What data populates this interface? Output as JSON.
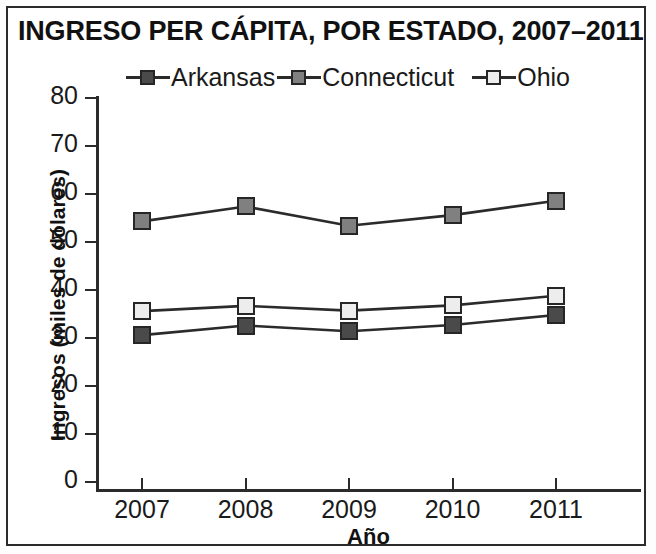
{
  "chart_data": {
    "type": "line",
    "title": "INGRESO PER CÁPITA, POR ESTADO, 2007–2011",
    "xlabel": "Año",
    "ylabel": "Ingresos (miles de dólares)",
    "categories": [
      "2007",
      "2008",
      "2009",
      "2010",
      "2011"
    ],
    "x": [
      2007,
      2008,
      2009,
      2010,
      2011
    ],
    "ylim": [
      0,
      80
    ],
    "yticks": [
      0,
      10,
      20,
      30,
      40,
      50,
      60,
      70,
      80
    ],
    "grid": false,
    "legend_position": "top",
    "series": [
      {
        "name": "Arkansas",
        "values": [
          30.6,
          32.6,
          31.4,
          32.7,
          34.8
        ],
        "marker": "square",
        "marker_fill": "#4a4a4a",
        "marker_edge": "#262626",
        "line_color": "#2b2b2b"
      },
      {
        "name": "Connecticut",
        "values": [
          54.3,
          57.4,
          53.4,
          55.6,
          58.6
        ],
        "marker": "square",
        "marker_fill": "#808080",
        "marker_edge": "#262626",
        "line_color": "#2b2b2b"
      },
      {
        "name": "Ohio",
        "values": [
          35.6,
          36.7,
          35.7,
          36.8,
          38.8
        ],
        "marker": "square",
        "marker_fill": "#ededed",
        "marker_edge": "#262626",
        "line_color": "#2b2b2b"
      }
    ]
  },
  "legend": {
    "items": [
      {
        "label": "Arkansas"
      },
      {
        "label": "Connecticut"
      },
      {
        "label": "Ohio"
      }
    ]
  },
  "axes": {
    "y_tick_labels": [
      "80",
      "70",
      "60",
      "50",
      "40",
      "30",
      "20",
      "10",
      "0"
    ],
    "x_tick_labels": [
      "2007",
      "2008",
      "2009",
      "2010",
      "2011"
    ]
  },
  "colors": {
    "frame": "#2b2b2b",
    "text": "#1a1a1a",
    "arkansas": "#4a4a4a",
    "connecticut": "#808080",
    "ohio": "#ededed"
  }
}
